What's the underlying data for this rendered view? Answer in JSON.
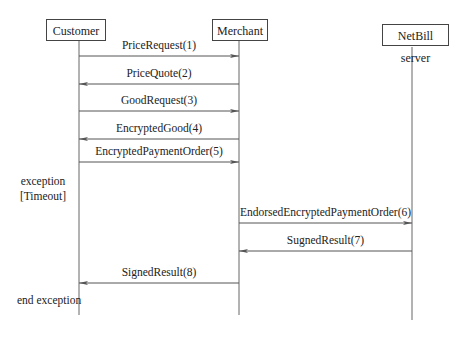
{
  "participants": [
    {
      "id": "customer",
      "label": "Customer"
    },
    {
      "id": "merchant",
      "label": "Merchant"
    },
    {
      "id": "netbill",
      "label": "NetBill server"
    }
  ],
  "messages": [
    {
      "label": "PriceRequest(1)",
      "from": "customer",
      "to": "merchant"
    },
    {
      "label": "PriceQuote(2)",
      "from": "merchant",
      "to": "customer"
    },
    {
      "label": "GoodRequest(3)",
      "from": "customer",
      "to": "merchant"
    },
    {
      "label": "EncryptedGood(4)",
      "from": "merchant",
      "to": "customer"
    },
    {
      "label": "EncryptedPaymentOrder(5)",
      "from": "customer",
      "to": "merchant"
    },
    {
      "label": "EndorsedEncryptedPaymentOrder(6)",
      "from": "merchant",
      "to": "netbill"
    },
    {
      "label": "SugnedResult(7)",
      "from": "netbill",
      "to": "merchant"
    },
    {
      "label": "SignedResult(8)",
      "from": "merchant",
      "to": "customer"
    }
  ],
  "exception": {
    "line1": "exception",
    "line2": "[Timeout]",
    "end": "end exception"
  }
}
